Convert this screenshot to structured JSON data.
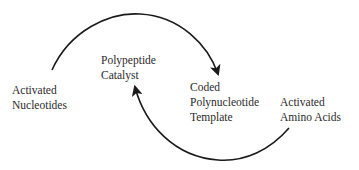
{
  "diagram": {
    "type": "cycle",
    "nodes": [
      {
        "id": "activated-nucleotides",
        "lines": [
          "Activated",
          "Nucleotides"
        ]
      },
      {
        "id": "polypeptide-catalyst",
        "lines": [
          "Polypeptide",
          "Catalyst"
        ]
      },
      {
        "id": "coded-polynucleotide-template",
        "lines": [
          "Coded",
          "Polynucleotide",
          "Template"
        ]
      },
      {
        "id": "activated-amino-acids",
        "lines": [
          "Activated",
          "Amino Acids"
        ]
      }
    ],
    "edges": [
      {
        "from": "activated-nucleotides",
        "to": "coded-polynucleotide-template",
        "style": "curved-arrow-over-top"
      },
      {
        "from": "activated-amino-acids",
        "to": "polypeptide-catalyst",
        "style": "curved-arrow-under-bottom"
      }
    ],
    "colors": {
      "line": "#1a1a1a",
      "text": "#2a2a2a",
      "background": "#ffffff"
    }
  }
}
